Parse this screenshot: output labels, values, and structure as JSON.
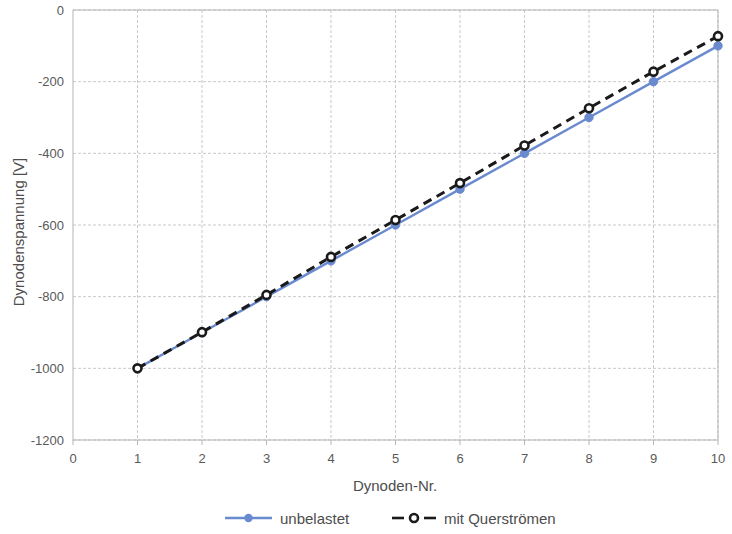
{
  "chart_data": {
    "type": "line",
    "title": "",
    "xlabel": "Dynoden-Nr.",
    "ylabel": "Dynodenspannung [V]",
    "xlim": [
      0,
      10
    ],
    "ylim": [
      -1200,
      0
    ],
    "xticks": [
      "0",
      "1",
      "2",
      "3",
      "4",
      "5",
      "6",
      "7",
      "8",
      "9",
      "10"
    ],
    "yticks": [
      "0",
      "-200",
      "-400",
      "-600",
      "-800",
      "-1000",
      "-1200"
    ],
    "grid": "horizontal-and-vertical-dashed",
    "legend_position": "bottom",
    "x": [
      1,
      2,
      3,
      4,
      5,
      6,
      7,
      8,
      9,
      10
    ],
    "series": [
      {
        "name": "unbelastet",
        "color": "#6A8AD0",
        "style": "solid",
        "marker": "filled-circle",
        "values": [
          -1000,
          -900,
          -800,
          -700,
          -600,
          -500,
          -400,
          -300,
          -200,
          -100
        ]
      },
      {
        "name": "mit Querströmen",
        "color": "#1a1a1a",
        "style": "dashed",
        "marker": "open-circle",
        "values": [
          -1000,
          -899,
          -795,
          -689,
          -586,
          -483,
          -378,
          -274,
          -172,
          -73
        ]
      }
    ]
  },
  "legend": {
    "items": [
      {
        "label": "unbelastet"
      },
      {
        "label": "mit Querströmen"
      }
    ]
  },
  "axes": {
    "x_title": "Dynoden-Nr.",
    "y_title": "Dynodenspannung [V]"
  }
}
